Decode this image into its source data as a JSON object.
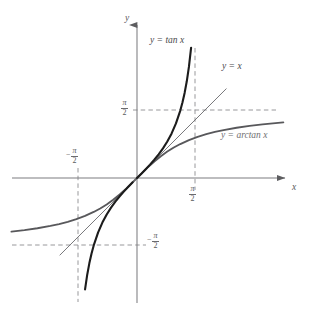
{
  "figure": {
    "type": "plot",
    "width": 311,
    "height": 322,
    "background": "#ffffff",
    "axis_color": "#7d7d80",
    "grid_dash_color": "#8d8d90",
    "axis_labels": {
      "x": "x",
      "y": "y"
    },
    "tick_labels": {
      "pi_over_2_numerator": "π",
      "pi_over_2_denominator": "2",
      "minus_sign": "−"
    },
    "curve_labels": {
      "tan": "y = tan x",
      "identity": "y = x",
      "arctan": "y = arctan x"
    }
  },
  "chart_data": {
    "type": "line",
    "title": "",
    "xlabel": "x",
    "ylabel": "y",
    "xlim": [
      -1.84,
      2.22
    ],
    "ylim": [
      -1.84,
      2.29
    ],
    "grid": false,
    "legend_position": "inline-annotations",
    "asymptotes": {
      "vertical": [
        -1.5708,
        1.5708
      ],
      "horizontal": [
        -1.5708,
        1.5708
      ],
      "style": "dashed",
      "label": "±π/2"
    },
    "axis_tick_values": [
      -1.5708,
      1.5708
    ],
    "axis_tick_text": [
      "-π/2",
      "π/2"
    ],
    "series": [
      {
        "name": "y = tan x",
        "color": "#1c1c1c",
        "width": 2.1,
        "domain": [
          -1.4,
          1.4
        ],
        "points": [
          [
            -1.4,
            -5.798
          ],
          [
            -1.35,
            -4.455
          ],
          [
            -1.3,
            -3.602
          ],
          [
            -1.25,
            -3.01
          ],
          [
            -1.2,
            -2.572
          ],
          [
            -1.15,
            -2.234
          ],
          [
            -1.1,
            -1.965
          ],
          [
            -1.05,
            -1.743
          ],
          [
            -1.0,
            -1.557
          ],
          [
            -0.9,
            -1.26
          ],
          [
            -0.8,
            -1.03
          ],
          [
            -0.7,
            -0.842
          ],
          [
            -0.6,
            -0.684
          ],
          [
            -0.5,
            -0.546
          ],
          [
            -0.4,
            -0.423
          ],
          [
            -0.3,
            -0.309
          ],
          [
            -0.2,
            -0.203
          ],
          [
            -0.1,
            -0.1
          ],
          [
            0.0,
            0.0
          ],
          [
            0.1,
            0.1
          ],
          [
            0.2,
            0.203
          ],
          [
            0.3,
            0.309
          ],
          [
            0.4,
            0.423
          ],
          [
            0.5,
            0.546
          ],
          [
            0.6,
            0.684
          ],
          [
            0.7,
            0.842
          ],
          [
            0.8,
            1.03
          ],
          [
            0.9,
            1.26
          ],
          [
            1.0,
            1.557
          ],
          [
            1.05,
            1.743
          ],
          [
            1.1,
            1.965
          ],
          [
            1.15,
            2.234
          ],
          [
            1.2,
            2.572
          ],
          [
            1.25,
            3.01
          ],
          [
            1.3,
            3.602
          ],
          [
            1.35,
            4.455
          ],
          [
            1.4,
            5.798
          ]
        ]
      },
      {
        "name": "y = x",
        "color": "#6a6a6d",
        "width": 0.9,
        "domain": [
          -1.78,
          2.06
        ],
        "points": [
          [
            -1.78,
            -1.78
          ],
          [
            2.06,
            2.06
          ]
        ]
      },
      {
        "name": "y = arctan x",
        "color": "#58585b",
        "width": 1.9,
        "domain": [
          -3.53,
          3.38
        ],
        "points": [
          [
            -3.53,
            -1.294
          ],
          [
            -3.2,
            -1.268
          ],
          [
            -2.9,
            -1.239
          ],
          [
            -2.6,
            -1.204
          ],
          [
            -2.3,
            -1.16
          ],
          [
            -2.0,
            -1.107
          ],
          [
            -1.8,
            -1.064
          ],
          [
            -1.6,
            -1.012
          ],
          [
            -1.4,
            -0.951
          ],
          [
            -1.2,
            -0.876
          ],
          [
            -1.0,
            -0.785
          ],
          [
            -0.85,
            -0.704
          ],
          [
            -0.7,
            -0.611
          ],
          [
            -0.55,
            -0.503
          ],
          [
            -0.4,
            -0.381
          ],
          [
            -0.25,
            -0.245
          ],
          [
            -0.12,
            -0.119
          ],
          [
            0.0,
            0.0
          ],
          [
            0.12,
            0.119
          ],
          [
            0.25,
            0.245
          ],
          [
            0.4,
            0.381
          ],
          [
            0.55,
            0.503
          ],
          [
            0.7,
            0.611
          ],
          [
            0.85,
            0.704
          ],
          [
            1.0,
            0.785
          ],
          [
            1.2,
            0.876
          ],
          [
            1.4,
            0.951
          ],
          [
            1.6,
            1.012
          ],
          [
            1.8,
            1.064
          ],
          [
            2.0,
            1.107
          ],
          [
            2.3,
            1.16
          ],
          [
            2.6,
            1.204
          ],
          [
            2.9,
            1.239
          ],
          [
            3.2,
            1.268
          ],
          [
            3.38,
            1.284
          ]
        ]
      }
    ]
  },
  "annotations": [
    {
      "id": "tan-label",
      "text": "y = tan x",
      "x": 150,
      "y": 40
    },
    {
      "id": "identity-label",
      "text": "y = x",
      "x": 222,
      "y": 65
    },
    {
      "id": "arctan-label",
      "text": "y = arctan x",
      "x": 222,
      "y": 134
    },
    {
      "id": "y-axis-label",
      "text": "y",
      "x": 126,
      "y": 15
    },
    {
      "id": "x-axis-label",
      "text": "x",
      "x": 292,
      "y": 184
    }
  ]
}
